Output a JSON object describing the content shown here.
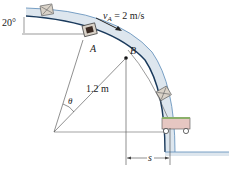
{
  "figure": {
    "velocity_label": "v",
    "velocity_subscript": "A",
    "velocity_value": " = 2 m/s",
    "angle_label": "20°",
    "point_a": "A",
    "point_b": "B",
    "radius_label": "1.2 m",
    "theta_label": "θ",
    "distance_label": "s"
  },
  "colors": {
    "track": "#dde6ee",
    "track_edge": "#1a3a5c",
    "track_inner": "#5a8ab8",
    "cart_body": "#e6c7c2",
    "cart_top": "#8bb06a",
    "lines": "#333333"
  }
}
